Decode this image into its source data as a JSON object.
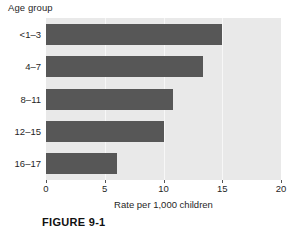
{
  "figure": {
    "caption": "FIGURE 9-1"
  },
  "chart_data": {
    "type": "bar",
    "orientation": "horizontal",
    "title": "Age group",
    "xlabel": "Rate per 1,000 children",
    "ylabel": "Age group",
    "categories": [
      "<1–3",
      "4–7",
      "8–11",
      "12–15",
      "16–17"
    ],
    "values": [
      15.0,
      13.4,
      10.8,
      10.0,
      6.0
    ],
    "xlim": [
      0,
      20
    ],
    "xticks": [
      0,
      5,
      10,
      15,
      20
    ],
    "xtick_labels": [
      "0",
      "5",
      "10",
      "15",
      "20"
    ],
    "grid": true,
    "grid_axis": "x",
    "legend": false,
    "colors": {
      "bar": "#575757",
      "plot_background": "#e9e9e9",
      "gridline": "#f7f7f7",
      "text": "#1f1f1f"
    }
  }
}
